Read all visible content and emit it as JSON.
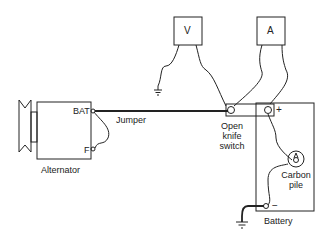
{
  "diagram": {
    "type": "wiring-diagram",
    "components": {
      "alternator": {
        "label": "Alternator",
        "terminals": {
          "bat": "BAT",
          "field": "F"
        }
      },
      "voltmeter": {
        "label": "V"
      },
      "ammeter": {
        "label": "A"
      },
      "switch": {
        "label_line1": "Open",
        "label_line2": "knife",
        "label_line3": "switch"
      },
      "battery": {
        "label": "Battery",
        "positive": "+",
        "negative": "−"
      },
      "carbon_pile": {
        "label_line1": "Carbon",
        "label_line2": "pile"
      },
      "jumper": {
        "label": "Jumper"
      }
    }
  }
}
